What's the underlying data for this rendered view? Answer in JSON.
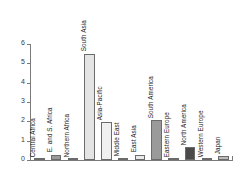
{
  "chart_data": {
    "type": "bar",
    "title": "",
    "subtitle": "",
    "xlabel": "",
    "ylabel": "",
    "ylim": [
      0,
      6
    ],
    "ytick_labels": [
      "0",
      "1",
      "2",
      "3",
      "4",
      "5",
      "6"
    ],
    "ytick_values": [
      0,
      1,
      2,
      3,
      4,
      5,
      6
    ],
    "grid": false,
    "legend": false,
    "legend_position": "none",
    "categories": [
      "Central Africa",
      "E. and S. Africa",
      "Northern Africa",
      "South Asia",
      "Asia-Pacific",
      "Middle East",
      "East Asia",
      "South America",
      "Eastern Europe",
      "North America",
      "Western Europe",
      "Japan"
    ],
    "values": [
      0.02,
      0.27,
      0.06,
      5.5,
      1.97,
      0.08,
      0.27,
      2.08,
      0.02,
      0.65,
      0.05,
      0.2
    ],
    "bar_colors": [
      "#b0b0b0",
      "#9a9a9a",
      "#c8c8c8",
      "#e4e4e4",
      "#f0f0f0",
      "#c0c0c0",
      "#ebebeb",
      "#9a9a9a",
      "#bdbdbd",
      "#4a4a4a",
      "#b8b8b8",
      "#bdbdbd"
    ],
    "bar_edge_color": "#6b6b6b",
    "axis_color": "#7a7a7a",
    "label_color": "#1c1c1c",
    "background": "#ffffff"
  }
}
